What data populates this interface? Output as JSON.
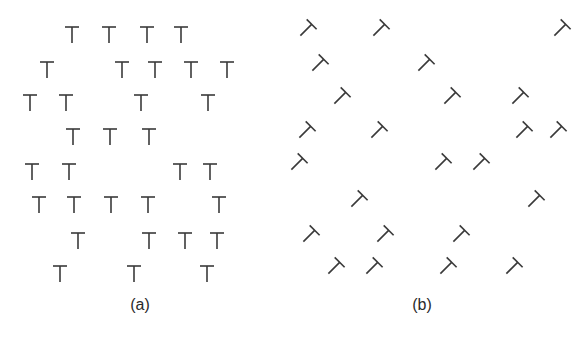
{
  "figure": {
    "stroke_color": "#3a3a3a",
    "background_color": "#ffffff"
  },
  "panels": [
    {
      "id": "a",
      "caption": "(a)",
      "element": "T",
      "orientation_deg": 0,
      "rows": [
        {
          "count": 4
        },
        {
          "count": 5
        },
        {
          "count": 4
        },
        {
          "count": 3
        },
        {
          "count": 4
        },
        {
          "count": 5
        },
        {
          "count": 4
        },
        {
          "count": 3
        }
      ],
      "total_elements": 32
    },
    {
      "id": "b",
      "caption": "(b)",
      "element": "T",
      "orientation_deg": 45,
      "rows": [
        {
          "count": 3
        },
        {
          "count": 2
        },
        {
          "count": 3
        },
        {
          "count": 4
        },
        {
          "count": 3
        },
        {
          "count": 2
        },
        {
          "count": 3
        },
        {
          "count": 4
        }
      ],
      "total_elements": 24
    }
  ]
}
